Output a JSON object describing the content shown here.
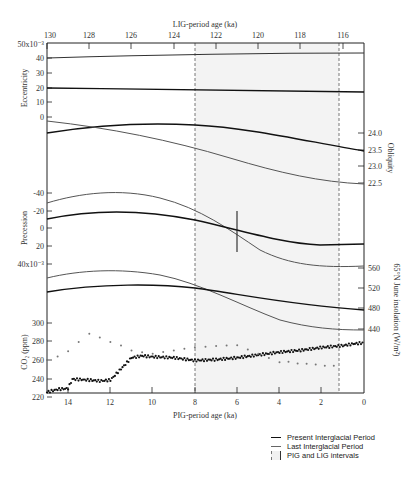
{
  "chart_data": {
    "type": "line",
    "title": "",
    "top_axis": {
      "label": "LIG-period age (ka)",
      "ticks": [
        130,
        128,
        126,
        124,
        122,
        120,
        118,
        116
      ]
    },
    "bottom_axis": {
      "label": "PIG-period age (ka)",
      "ticks": [
        14,
        12,
        10,
        8,
        6,
        4,
        2,
        0
      ],
      "range": [
        15,
        0
      ]
    },
    "panels": [
      {
        "name": "Eccentricity",
        "ylabel": "Eccentricity",
        "side": "left",
        "ticks": [
          "50x10-3",
          "40",
          "30",
          "20",
          "10",
          "0"
        ],
        "series": [
          {
            "name": "Last Interglacial Period",
            "values_desc": "rising slowly from ~40 to ~42 x10^-3"
          },
          {
            "name": "Present Interglacial Period",
            "values_desc": "declining slowly from ~20 to ~17 x10^-3"
          }
        ]
      },
      {
        "name": "Obliquity",
        "ylabel": "Obliquity",
        "side": "right",
        "ticks": [
          "24.0",
          "23.5",
          "23.0",
          "22.5"
        ],
        "series": [
          {
            "name": "Present Interglacial Period",
            "start": 23.9,
            "peak": 24.2,
            "end": 23.45
          },
          {
            "name": "Last Interglacial Period",
            "start": 24.1,
            "end": 22.5
          }
        ]
      },
      {
        "name": "Precession",
        "ylabel": "Precession",
        "side": "left",
        "ticks": [
          "-40",
          "-20",
          "0",
          "20",
          "40x10-3"
        ],
        "series": [
          {
            "name": "Last Interglacial Period",
            "start": -29,
            "peak": -40,
            "end": 49
          },
          {
            "name": "Present Interglacial Period",
            "start": -11,
            "peak": -19,
            "end": 24
          }
        ]
      },
      {
        "name": "65N June insolation",
        "ylabel": "65°N June insolation (W/m²)",
        "side": "right",
        "ticks": [
          "560",
          "520",
          "480",
          "440"
        ],
        "series": [
          {
            "name": "Last Interglacial Period",
            "start": 528,
            "peak": 540,
            "end": 438
          },
          {
            "name": "Present Interglacial Period",
            "start": 500,
            "peak": 525,
            "end": 478
          }
        ]
      },
      {
        "name": "CO2",
        "ylabel": "CO2 (ppm)",
        "side": "left",
        "ticks": [
          "300",
          "280",
          "260",
          "240",
          "220"
        ],
        "series": [
          {
            "name": "Present Interglacial Period (PIG) CO2",
            "x_ka": [
              15,
              14.5,
              14,
              13.8,
              13,
              12.5,
              12,
              11.5,
              11,
              10.5,
              10,
              9,
              8,
              7,
              6,
              5,
              4,
              3,
              2,
              1,
              0.5,
              0
            ],
            "values": [
              225,
              228,
              229,
              239,
              238,
              237,
              238,
              250,
              262,
              264,
              263,
              262,
              259,
              260,
              262,
              265,
              268,
              270,
              273,
              275,
              277,
              278
            ]
          },
          {
            "name": "Last Interglacial Period (LIG) CO2",
            "x_ka": [
              15,
              14.5,
              14,
              13.5,
              13,
              12.5,
              12,
              11.5,
              11,
              10.5,
              10,
              8,
              6,
              4,
              1
            ],
            "values": [
              260,
              264,
              270,
              280,
              289,
              285,
              280,
              276,
              270,
              268,
              266,
              272,
              275,
              258,
              252
            ]
          }
        ]
      }
    ],
    "shaded_interval": {
      "from_ka": 8,
      "to_ka": 1.2,
      "label": "PIG and LIG intervals"
    },
    "marker": {
      "x_ka": 6,
      "panel": "Precession",
      "type": "vertical-bar"
    },
    "legend": [
      {
        "label": "Present Interglacial Period",
        "style": "thick-black"
      },
      {
        "label": "Last Interglacial Period",
        "style": "thin-gray"
      },
      {
        "label": "PIG and LIG intervals",
        "style": "dashed-shaded-box"
      }
    ]
  },
  "labels": {
    "top_axis_title": "LIG-period age (ka)",
    "bottom_axis_title": "PIG-period age (ka)",
    "ecc_label": "Eccentricity",
    "obl_label": "Obliquity",
    "prec_label": "Precession",
    "ins_label": "65°N June insolation  (W/m²)",
    "co2_label": "CO₂ (ppm)",
    "ecc_top": "50x10⁻³",
    "prec_bottom": "40x10⁻³",
    "legend_present": "Present Interglacial Period",
    "legend_last": "Last Interglacial Period",
    "legend_interval": "PIG and LIG intervals"
  },
  "ticks": {
    "top": [
      "130",
      "128",
      "126",
      "124",
      "122",
      "120",
      "118",
      "116"
    ],
    "bottom": [
      "14",
      "12",
      "10",
      "8",
      "6",
      "4",
      "2",
      "0"
    ],
    "ecc": [
      "40",
      "30",
      "20",
      "10",
      "0"
    ],
    "obl": [
      "24.0",
      "23.5",
      "23.0",
      "22.5"
    ],
    "prec": [
      "-40",
      "-20",
      "0",
      "20"
    ],
    "ins": [
      "560",
      "520",
      "480",
      "440"
    ],
    "co2": [
      "300",
      "280",
      "260",
      "240",
      "220"
    ]
  }
}
